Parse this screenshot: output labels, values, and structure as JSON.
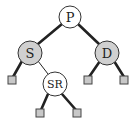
{
  "diagram": {
    "type": "binary-tree",
    "colors": {
      "background": "#ffffff",
      "red_node_fill": "#ffffff",
      "black_node_fill": "#d0d0d0",
      "stroke": "#222222",
      "leaf_fill": "#c8c8c8"
    },
    "nodes": [
      {
        "id": "P",
        "label": "P",
        "fill": "white"
      },
      {
        "id": "S",
        "label": "S",
        "fill": "gray"
      },
      {
        "id": "D",
        "label": "D",
        "fill": "gray"
      },
      {
        "id": "SR",
        "label": "SR",
        "fill": "white"
      }
    ],
    "leaves": [
      {
        "id": "S-left-leaf",
        "parent": "S"
      },
      {
        "id": "SR-left-leaf",
        "parent": "SR"
      },
      {
        "id": "SR-right-leaf",
        "parent": "SR"
      },
      {
        "id": "D-left-leaf",
        "parent": "D"
      },
      {
        "id": "D-right-leaf",
        "parent": "D"
      }
    ],
    "edges": [
      {
        "from": "P",
        "to": "S",
        "style": "thick"
      },
      {
        "from": "P",
        "to": "D",
        "style": "thick"
      },
      {
        "from": "S",
        "to": "S-left-leaf",
        "style": "thick"
      },
      {
        "from": "S",
        "to": "SR",
        "style": "thin"
      },
      {
        "from": "SR",
        "to": "SR-left-leaf",
        "style": "thick"
      },
      {
        "from": "SR",
        "to": "SR-right-leaf",
        "style": "thick"
      },
      {
        "from": "D",
        "to": "D-left-leaf",
        "style": "thick"
      },
      {
        "from": "D",
        "to": "D-right-leaf",
        "style": "thick"
      }
    ]
  }
}
